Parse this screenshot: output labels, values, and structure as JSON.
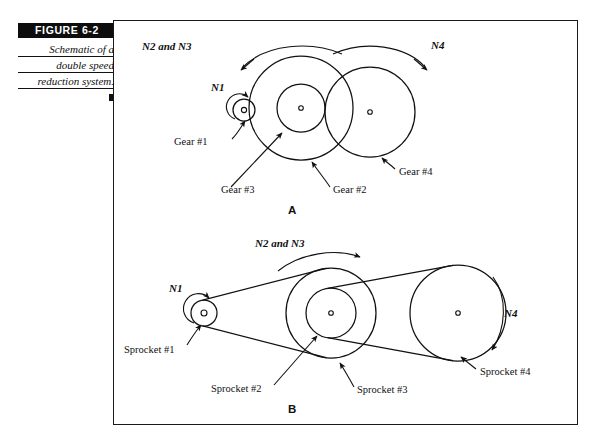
{
  "figure": {
    "badge_label": "FIGURE  6-2",
    "caption_lines": [
      "Schematic of a",
      "double speed",
      "reduction system."
    ],
    "end_marker": "square-marker"
  },
  "diagram_a": {
    "sublabel": "A",
    "speed_labels": [
      {
        "name": "N1",
        "text": "N1"
      },
      {
        "name": "N2-and-N3",
        "text": "N2 and N3"
      },
      {
        "name": "N4",
        "text": "N4"
      }
    ],
    "part_labels": [
      {
        "name": "gear-1",
        "text": "Gear #1"
      },
      {
        "name": "gear-3",
        "text": "Gear #3"
      },
      {
        "name": "gear-2",
        "text": "Gear #2"
      },
      {
        "name": "gear-4",
        "text": "Gear #4"
      }
    ]
  },
  "diagram_b": {
    "sublabel": "B",
    "speed_labels": [
      {
        "name": "N1",
        "text": "N1"
      },
      {
        "name": "N2-and-N3",
        "text": "N2 and N3"
      },
      {
        "name": "N4",
        "text": "N4"
      }
    ],
    "part_labels": [
      {
        "name": "sprocket-1",
        "text": "Sprocket #1"
      },
      {
        "name": "sprocket-2",
        "text": "Sprocket #2"
      },
      {
        "name": "sprocket-3",
        "text": "Sprocket #3"
      },
      {
        "name": "sprocket-4",
        "text": "Sprocket #4"
      }
    ]
  },
  "colors": {
    "ink": "#111111",
    "badge_bg": "#0d0d0d",
    "paper": "#ffffff"
  }
}
